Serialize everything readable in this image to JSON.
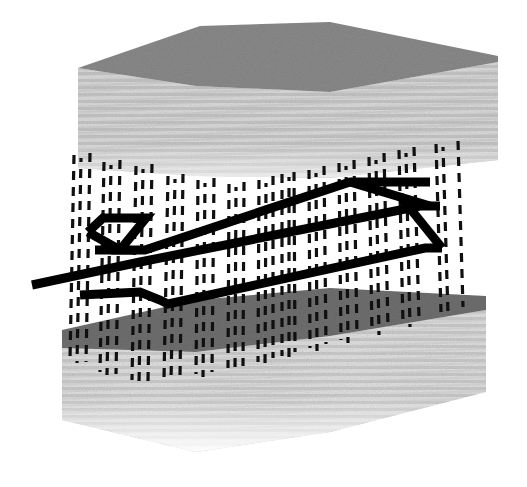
{
  "figure": {
    "title": "3D block diagram with dashed vertical traces and thick black outlined structure",
    "width": 527,
    "height": 487,
    "background_color": "#ffffff",
    "render_style": "scanned halftone / dithered grayscale line art"
  },
  "palette": {
    "background": "#ffffff",
    "block_top_face_upper": "#8a8a8a",
    "block_top_face_lower": "#6f6f6f",
    "block_front_face": "#d4d4d4",
    "block_front_face_light": "#e2e2e2",
    "block_stripe": "#bdbdbd",
    "dashed_trace": "#101010",
    "thick_outline": "#000000"
  },
  "upper_block": {
    "name": "upper-slab",
    "top_face_color": "#8a8a8a",
    "front_face_color": "#d4d4d4",
    "top_face_polygon": "78,68 200,26 330,22 498,56 498,62 330,92 196,86",
    "front_face_polygon": "78,68 196,86 330,92 498,62 498,160 330,178 196,176 78,168",
    "stripe_count": 22,
    "stripe_color": "#c0c0c0"
  },
  "lower_block": {
    "name": "lower-slab",
    "top_face_color": "#6f6f6f",
    "front_face_color": "#dcdcdc",
    "top_face_polygon": "62,330 196,300 330,288 486,296 486,310 330,336 196,352 62,348",
    "front_face_polygon": "62,348 196,352 330,336 486,310 486,392 330,432 196,452 62,420",
    "stripe_count": 20,
    "stripe_color": "#c6c6c6"
  },
  "dashed_traces": {
    "name": "vertical-dashed-traces",
    "description": "Near-vertical dashed lines (well paths / raypaths) spanning from the upper slab down into the lower slab",
    "count": 26,
    "color": "#101010",
    "dash_pattern": "9 7",
    "stroke_width": 3.2,
    "lines": [
      {
        "x1": 74,
        "y1": 155,
        "x2": 70,
        "y2": 360
      },
      {
        "x1": 90,
        "y1": 153,
        "x2": 86,
        "y2": 362
      },
      {
        "x1": 104,
        "y1": 162,
        "x2": 100,
        "y2": 372
      },
      {
        "x1": 120,
        "y1": 160,
        "x2": 116,
        "y2": 374
      },
      {
        "x1": 136,
        "y1": 166,
        "x2": 132,
        "y2": 380
      },
      {
        "x1": 152,
        "y1": 164,
        "x2": 148,
        "y2": 381
      },
      {
        "x1": 168,
        "y1": 176,
        "x2": 164,
        "y2": 378
      },
      {
        "x1": 183,
        "y1": 174,
        "x2": 180,
        "y2": 376
      },
      {
        "x1": 198,
        "y1": 180,
        "x2": 196,
        "y2": 374
      },
      {
        "x1": 214,
        "y1": 178,
        "x2": 212,
        "y2": 372
      },
      {
        "x1": 229,
        "y1": 184,
        "x2": 228,
        "y2": 368
      },
      {
        "x1": 244,
        "y1": 182,
        "x2": 243,
        "y2": 366
      },
      {
        "x1": 259,
        "y1": 180,
        "x2": 258,
        "y2": 362
      },
      {
        "x1": 273,
        "y1": 176,
        "x2": 273,
        "y2": 358
      },
      {
        "x1": 282,
        "y1": 174,
        "x2": 282,
        "y2": 356
      },
      {
        "x1": 294,
        "y1": 172,
        "x2": 295,
        "y2": 352
      },
      {
        "x1": 309,
        "y1": 170,
        "x2": 310,
        "y2": 348
      },
      {
        "x1": 324,
        "y1": 166,
        "x2": 326,
        "y2": 344
      },
      {
        "x1": 339,
        "y1": 163,
        "x2": 341,
        "y2": 340
      },
      {
        "x1": 354,
        "y1": 160,
        "x2": 357,
        "y2": 336
      },
      {
        "x1": 369,
        "y1": 157,
        "x2": 372,
        "y2": 332
      },
      {
        "x1": 384,
        "y1": 153,
        "x2": 388,
        "y2": 328
      },
      {
        "x1": 399,
        "y1": 150,
        "x2": 403,
        "y2": 324
      },
      {
        "x1": 414,
        "y1": 147,
        "x2": 419,
        "y2": 318
      },
      {
        "x1": 436,
        "y1": 144,
        "x2": 441,
        "y2": 312
      },
      {
        "x1": 458,
        "y1": 141,
        "x2": 463,
        "y2": 307
      }
    ]
  },
  "outline_structure": {
    "name": "thick-black-outline-structure",
    "description": "Heavy black polyline frame: an elongated parallelogram with a Z-shaped notch at the left end and a converging triangular tip at the right end",
    "color": "#000000",
    "stroke_width": 9,
    "paths": [
      {
        "id": "upper-rail",
        "points": "88,232 103,218 146,218 120,250 145,250 350,182 430,182"
      },
      {
        "id": "mid-rail",
        "points": "32,285 140,262 420,206 440,206"
      },
      {
        "id": "lower-rail",
        "points": "80,295 140,292 160,300 168,304 425,248 442,248"
      },
      {
        "id": "right-diagonal-upper",
        "points": "350,182 430,206"
      },
      {
        "id": "right-diagonal-lower",
        "points": "400,196 442,248"
      },
      {
        "id": "left-zigzag",
        "points": "88,232 120,250 95,250"
      }
    ]
  },
  "annotations": {
    "visible_text": [],
    "caption": ""
  }
}
